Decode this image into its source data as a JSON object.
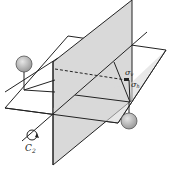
{
  "diagram": {
    "labels": {
      "sigma_v": "σ",
      "sigma_v_sub": "v",
      "sigma_h": "σ",
      "sigma_h_sub": "h",
      "c2": "C",
      "c2_sub": "2"
    },
    "colors": {
      "plane_fill": "#d9d9d9",
      "line": "#222222",
      "atom_fill": "#b8b8b8",
      "atom_stroke": "#555555"
    }
  }
}
